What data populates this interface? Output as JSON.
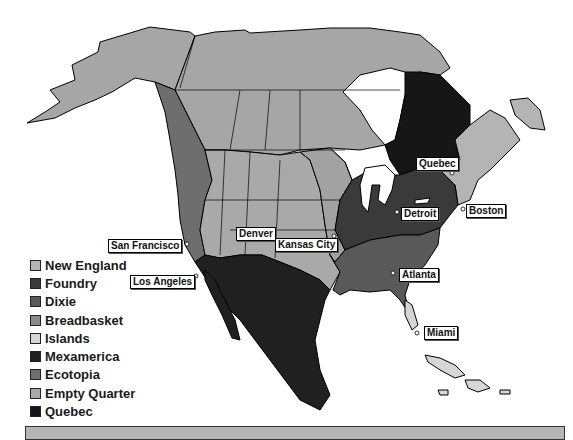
{
  "colors": {
    "new_england": "#b4b4b4",
    "foundry": "#3a3a3a",
    "dixie": "#595959",
    "breadbasket": "#8a8a8a",
    "islands": "#d6d6d6",
    "mexamerica": "#202020",
    "ecotopia": "#6e6e6e",
    "empty_quarter": "#a9a9a9",
    "quebec": "#161616",
    "canada": "#a6a6a6",
    "border": "#000000"
  },
  "legend": [
    {
      "label": "New England",
      "color": "#b4b4b4"
    },
    {
      "label": "Foundry",
      "color": "#3a3a3a"
    },
    {
      "label": "Dixie",
      "color": "#595959"
    },
    {
      "label": "Breadbasket",
      "color": "#8a8a8a"
    },
    {
      "label": "Islands",
      "color": "#d6d6d6"
    },
    {
      "label": "Mexamerica",
      "color": "#202020"
    },
    {
      "label": "Ecotopia",
      "color": "#6e6e6e"
    },
    {
      "label": "Empty Quarter",
      "color": "#a9a9a9"
    },
    {
      "label": "Quebec",
      "color": "#161616"
    }
  ],
  "cities": [
    {
      "name": "Quebec",
      "x": 416,
      "y": 157
    },
    {
      "name": "Detroit",
      "x": 401,
      "y": 207
    },
    {
      "name": "Boston",
      "x": 466,
      "y": 204
    },
    {
      "name": "San Francisco",
      "x": 108,
      "y": 239
    },
    {
      "name": "Denver",
      "x": 236,
      "y": 227
    },
    {
      "name": "Kansas City",
      "x": 275,
      "y": 238
    },
    {
      "name": "Los Angeles",
      "x": 130,
      "y": 275
    },
    {
      "name": "Atlanta",
      "x": 399,
      "y": 268
    },
    {
      "name": "Miami",
      "x": 424,
      "y": 326
    }
  ]
}
